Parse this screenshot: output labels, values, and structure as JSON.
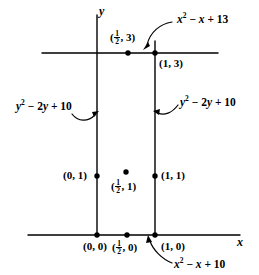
{
  "figure": {
    "type": "geometry-diagram",
    "axes": {
      "y_axis_label": "y",
      "x_axis_label": "x"
    },
    "points": [
      {
        "id": "p-origin",
        "label": "(0, 0)",
        "x": 0,
        "y": 0
      },
      {
        "id": "p-half-0",
        "label_pre": "(",
        "frac_num": "1",
        "frac_den": "2",
        "label_post": ", 0)",
        "x": 0.5,
        "y": 0
      },
      {
        "id": "p-one-0",
        "label": "(1, 0)",
        "x": 1,
        "y": 0
      },
      {
        "id": "p-zero-1",
        "label": "(0, 1)",
        "x": 0,
        "y": 1
      },
      {
        "id": "p-half-1",
        "label_pre": "(",
        "frac_num": "1",
        "frac_den": "2",
        "label_post": ", 1)",
        "x": 0.5,
        "y": 1
      },
      {
        "id": "p-one-1",
        "label": "(1, 1)",
        "x": 1,
        "y": 1
      },
      {
        "id": "p-half-3",
        "label_pre": "(",
        "frac_num": "1",
        "frac_den": "2",
        "label_post": ", 3)",
        "x": 0.5,
        "y": 3
      },
      {
        "id": "p-one-3",
        "label": "(1, 3)",
        "x": 1,
        "y": 3
      }
    ],
    "expressions": [
      {
        "id": "expr-top-right",
        "text": "x² − x + 13",
        "var": "x",
        "exp": "2",
        "tail": " − ",
        "var2": "x",
        "tail2": " + 13"
      },
      {
        "id": "expr-left",
        "text": "y² − 2y + 10",
        "var": "y",
        "exp": "2",
        "tail": " − 2",
        "var2": "y",
        "tail2": " + 10"
      },
      {
        "id": "expr-right",
        "text": "y² − 2y + 10",
        "var": "y",
        "exp": "2",
        "tail": " − 2",
        "var2": "y",
        "tail2": " + 10"
      },
      {
        "id": "expr-bottom",
        "text": "x² − x + 10",
        "var": "x",
        "exp": "2",
        "tail": " − ",
        "var2": "x",
        "tail2": " + 10"
      }
    ],
    "colors": {
      "ink": "#000000",
      "background": "#ffffff"
    }
  }
}
